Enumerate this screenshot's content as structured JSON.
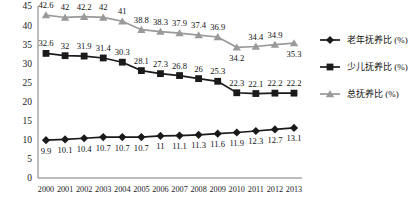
{
  "chart_data": {
    "type": "line",
    "title": "",
    "xlabel": "",
    "ylabel": "",
    "ylim": [
      0,
      45
    ],
    "yticks": [
      0,
      5,
      10,
      15,
      20,
      25,
      30,
      35,
      40,
      45
    ],
    "grid": false,
    "legend_position": "right",
    "categories": [
      "2000",
      "2001",
      "2002",
      "2003",
      "2004",
      "2005",
      "2006",
      "2007",
      "2008",
      "2009",
      "2010",
      "2011",
      "2012",
      "2013"
    ],
    "series": [
      {
        "name": "老年抚养比 (%)",
        "marker": "diamond",
        "color": "#1a1a1a",
        "label_position": "below",
        "values": [
          9.9,
          10.1,
          10.4,
          10.7,
          10.7,
          10.7,
          11,
          11.1,
          11.3,
          11.6,
          11.9,
          12.3,
          12.7,
          13.1
        ],
        "value_labels": [
          "9.9",
          "10.1",
          "10.4",
          "10.7",
          "10.7",
          "10.7",
          "11",
          "11.1",
          "11.3",
          "11.6",
          "11.9",
          "12.3",
          "12.7",
          "13.1"
        ]
      },
      {
        "name": "少儿抚养比 (%)",
        "marker": "square",
        "color": "#1a1a1a",
        "label_position": "above",
        "values": [
          32.6,
          32,
          31.9,
          31.4,
          30.3,
          28.1,
          27.3,
          26.8,
          26,
          25.3,
          22.3,
          22.1,
          22.2,
          22.2
        ],
        "value_labels": [
          "32.6",
          "32",
          "31.9",
          "31.4",
          "30.3",
          "28.1",
          "27.3",
          "26.8",
          "26",
          "25.3",
          "22.3",
          "22.1",
          "22.2",
          "22.2"
        ]
      },
      {
        "name": "总抚养比 (%)",
        "marker": "triangle",
        "color": "#9a9a9a",
        "label_position": "above",
        "values": [
          42.6,
          42,
          42.2,
          42,
          41,
          38.8,
          38.3,
          37.9,
          37.4,
          36.9,
          34.2,
          34.4,
          34.9,
          35.3
        ],
        "value_labels": [
          "42.6",
          "42",
          "42.2",
          "42",
          "41",
          "38.8",
          "38.3",
          "37.9",
          "37.4",
          "36.9",
          "34.2",
          "34.4",
          "34.9",
          "35.3"
        ],
        "label_overrides": {
          "10": "below",
          "13": "below"
        }
      }
    ]
  },
  "legend": {
    "items": [
      {
        "label": "老年抚养比 (%)",
        "marker": "diamond",
        "color": "#1a1a1a"
      },
      {
        "label": "少儿抚养比 (%)",
        "marker": "square",
        "color": "#1a1a1a"
      },
      {
        "label": "总抚养比 (%)",
        "marker": "triangle",
        "color": "#9a9a9a"
      }
    ]
  }
}
